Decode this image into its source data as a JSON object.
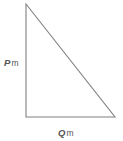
{
  "figure": {
    "type": "right-triangle-diagram",
    "background_color": "#ffffff",
    "stroke_color": "#808080",
    "stroke_width": 1,
    "width": 123,
    "height": 141,
    "vertices": {
      "apex": [
        26,
        4
      ],
      "right_angle": [
        26,
        117
      ],
      "base_right": [
        115,
        117
      ]
    },
    "labels": {
      "vertical_side": {
        "variable": "P",
        "unit": "m",
        "full": "P m",
        "position": [
          4,
          58
        ]
      },
      "horizontal_side": {
        "variable": "Q",
        "unit": "m",
        "full": "Q m",
        "position": [
          58,
          128
        ]
      }
    }
  }
}
